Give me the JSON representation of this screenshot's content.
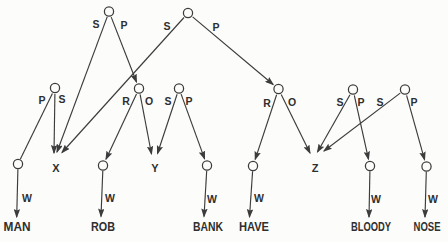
{
  "figure": {
    "type": "semantic-network",
    "colors": {
      "background": "#fcfcfb",
      "line": "#3c3c3c",
      "text": "#2f2f2f",
      "node_fill": "#fcfcfb"
    },
    "node_radius": 4.6,
    "nodes": [
      {
        "id": "proposition-1",
        "x": 109,
        "y": 11.5
      },
      {
        "id": "proposition-2",
        "x": 188,
        "y": 13
      },
      {
        "id": "fact-man",
        "x": 55,
        "y": 88
      },
      {
        "id": "predicate-rob",
        "x": 139,
        "y": 88.5
      },
      {
        "id": "fact-bank",
        "x": 179,
        "y": 88.5
      },
      {
        "id": "predicate-have",
        "x": 278.5,
        "y": 89
      },
      {
        "id": "fact-bloody",
        "x": 353,
        "y": 89.5
      },
      {
        "id": "fact-nose",
        "x": 405,
        "y": 89.5
      },
      {
        "id": "concept-man",
        "x": 18,
        "y": 164
      },
      {
        "id": "concept-rob",
        "x": 103,
        "y": 165.5
      },
      {
        "id": "concept-bank",
        "x": 207,
        "y": 165.5
      },
      {
        "id": "concept-have",
        "x": 253,
        "y": 166
      },
      {
        "id": "concept-bloody",
        "x": 370,
        "y": 166
      },
      {
        "id": "concept-nose",
        "x": 426.5,
        "y": 166.5
      }
    ],
    "variables": [
      {
        "id": "var-x",
        "label": "X",
        "x": 56,
        "y": 172
      },
      {
        "id": "var-y",
        "label": "Y",
        "x": 155,
        "y": 172
      },
      {
        "id": "var-z",
        "label": "Z",
        "x": 315,
        "y": 172
      }
    ],
    "words": [
      {
        "id": "word-man",
        "label": "MAN",
        "x": 17,
        "y": 231,
        "w": 27
      },
      {
        "id": "word-rob",
        "label": "ROB",
        "x": 103,
        "y": 231,
        "w": 24
      },
      {
        "id": "word-bank",
        "label": "BANK",
        "x": 208,
        "y": 231,
        "w": 30
      },
      {
        "id": "word-have",
        "label": "HAVE",
        "x": 254,
        "y": 231,
        "w": 30
      },
      {
        "id": "word-bloody",
        "label": "BLOODY",
        "x": 371,
        "y": 231,
        "w": 40
      },
      {
        "id": "word-nose",
        "label": "NOSE",
        "x": 427,
        "y": 231,
        "w": 27
      }
    ],
    "edges": [
      {
        "name": "prop1-subject-arc",
        "label": "S",
        "lx": 96,
        "ly": 28,
        "x1": 107.2,
        "y1": 16.9,
        "x2": 57,
        "y2": 152,
        "arrow": true
      },
      {
        "name": "prop1-predicate-arc",
        "label": "P",
        "lx": 124,
        "ly": 29,
        "x1": 111.2,
        "y1": 17.1,
        "x2": 136.5,
        "y2": 82,
        "arrow": true
      },
      {
        "name": "prop2-subject-arc",
        "label": "S",
        "lx": 167,
        "ly": 30,
        "x1": 184,
        "y1": 17.5,
        "x2": 62,
        "y2": 152.5,
        "arrow": true
      },
      {
        "name": "prop2-predicate-arc",
        "label": "P",
        "lx": 216,
        "ly": 31,
        "x1": 192.6,
        "y1": 16.9,
        "x2": 273.1,
        "y2": 84.5,
        "arrow": true
      },
      {
        "name": "fact-man-predicate-arc",
        "label": "P",
        "lx": 42,
        "ly": 104,
        "x1": 52.4,
        "y1": 93.4,
        "x2": 20.3,
        "y2": 159.3,
        "arrow": false
      },
      {
        "name": "fact-man-subject-arc",
        "label": "S",
        "lx": 62,
        "ly": 103,
        "x1": 54.9,
        "y1": 94,
        "x2": 54,
        "y2": 153,
        "arrow": true
      },
      {
        "name": "predicate-rob-relation-arc",
        "label": "R",
        "lx": 126,
        "ly": 105,
        "x1": 136.5,
        "y1": 93.9,
        "x2": 106,
        "y2": 159.2,
        "arrow": true
      },
      {
        "name": "predicate-rob-object-arc",
        "label": "O",
        "lx": 149,
        "ly": 105,
        "x1": 140.1,
        "y1": 94.4,
        "x2": 151.5,
        "y2": 154,
        "arrow": true
      },
      {
        "name": "fact-bank-subject-arc",
        "label": "S",
        "lx": 168,
        "ly": 105,
        "x1": 177.1,
        "y1": 94.2,
        "x2": 157.5,
        "y2": 153.5,
        "arrow": true
      },
      {
        "name": "fact-bank-predicate-arc",
        "label": "P",
        "lx": 189,
        "ly": 105,
        "x1": 181.1,
        "y1": 94.1,
        "x2": 204.6,
        "y2": 158.9,
        "arrow": true
      },
      {
        "name": "predicate-have-relation-arc",
        "label": "R",
        "lx": 267,
        "ly": 107,
        "x1": 276.6,
        "y1": 94.7,
        "x2": 255.2,
        "y2": 159.4,
        "arrow": true
      },
      {
        "name": "predicate-have-object-arc",
        "label": "O",
        "lx": 292,
        "ly": 106,
        "x1": 281.2,
        "y1": 94.4,
        "x2": 310,
        "y2": 153,
        "arrow": true
      },
      {
        "name": "fact-bloody-subject-arc",
        "label": "S",
        "lx": 340,
        "ly": 106,
        "x1": 350,
        "y1": 94.7,
        "x2": 317.5,
        "y2": 152,
        "arrow": true
      },
      {
        "name": "fact-bloody-predicate-arc",
        "label": "P",
        "lx": 361,
        "ly": 106,
        "x1": 354.3,
        "y1": 95.4,
        "x2": 368.5,
        "y2": 159.2,
        "arrow": true
      },
      {
        "name": "fact-nose-subject-arc",
        "label": "S",
        "lx": 380,
        "ly": 106,
        "x1": 400.2,
        "y1": 93.1,
        "x2": 324,
        "y2": 151,
        "arrow": true
      },
      {
        "name": "fact-nose-predicate-arc",
        "label": "P",
        "lx": 414,
        "ly": 106,
        "x1": 406.6,
        "y1": 95.3,
        "x2": 424.6,
        "y2": 159.8,
        "arrow": true
      },
      {
        "name": "word-arc-man",
        "label": "W",
        "lx": 27,
        "ly": 202,
        "x1": 17.9,
        "y1": 169.2,
        "x2": 16.7,
        "y2": 217,
        "arrow": true
      },
      {
        "name": "word-arc-rob",
        "label": "W",
        "lx": 110,
        "ly": 202,
        "x1": 102.8,
        "y1": 170.7,
        "x2": 101,
        "y2": 216.5,
        "arrow": true
      },
      {
        "name": "word-arc-bank",
        "label": "W",
        "lx": 212,
        "ly": 203,
        "x1": 206.7,
        "y1": 170.7,
        "x2": 204,
        "y2": 216.5,
        "arrow": true
      },
      {
        "name": "word-arc-have",
        "label": "W",
        "lx": 259,
        "ly": 202,
        "x1": 252.6,
        "y1": 171.2,
        "x2": 249.5,
        "y2": 217,
        "arrow": true
      },
      {
        "name": "word-arc-bloody",
        "label": "W",
        "lx": 376,
        "ly": 203,
        "x1": 369.9,
        "y1": 171.2,
        "x2": 369,
        "y2": 217,
        "arrow": true
      },
      {
        "name": "word-arc-nose",
        "label": "W",
        "lx": 433,
        "ly": 203,
        "x1": 426.3,
        "y1": 171.7,
        "x2": 425,
        "y2": 217,
        "arrow": true
      }
    ]
  }
}
